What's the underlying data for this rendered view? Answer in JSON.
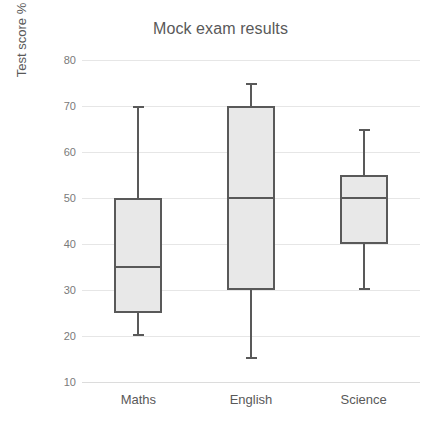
{
  "chart_data": {
    "type": "box",
    "title": "Mock exam results",
    "xlabel": "",
    "ylabel": "Test score %",
    "categories": [
      "Maths",
      "English",
      "Science"
    ],
    "ylim": [
      10,
      80
    ],
    "yticks": [
      10,
      20,
      30,
      40,
      50,
      60,
      70,
      80
    ],
    "ytick_labels": [
      "10",
      "20",
      "30",
      "40",
      "50",
      "60",
      "70",
      "80"
    ],
    "grid": true,
    "legend": "none",
    "boxes": [
      {
        "category": "Maths",
        "min": 20,
        "q1": 25,
        "median": 35,
        "q3": 50,
        "max": 70
      },
      {
        "category": "English",
        "min": 15,
        "q1": 30,
        "median": 50,
        "q3": 70,
        "max": 75
      },
      {
        "category": "Science",
        "min": 30,
        "q1": 40,
        "median": 50,
        "q3": 55,
        "max": 65
      }
    ],
    "colors": {
      "box_fill": "#e8e8e8",
      "box_border": "#595959",
      "median": "#595959",
      "whisker": "#595959",
      "gridline": "#e6e6e6",
      "text": "#595959",
      "tick_text": "#7a7a7a",
      "background": "#ffffff"
    }
  }
}
